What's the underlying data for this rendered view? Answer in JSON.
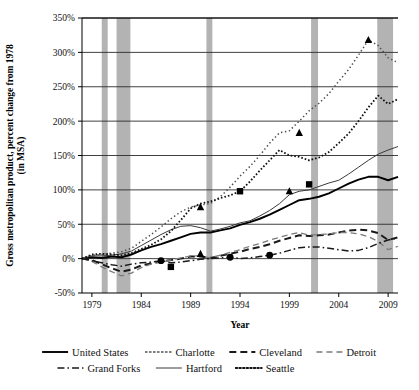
{
  "chart_data": {
    "type": "line",
    "title": "",
    "xlabel": "Year",
    "ylabel": "Gross metropolitan product, percent change from 1978 (in MSA)",
    "ylabel_line1": "Gross metropolitan product, percent change from 1978",
    "ylabel_line2": "(in MSA)",
    "xlim": [
      1978,
      2010
    ],
    "ylim": [
      -50,
      350
    ],
    "ytick_step": 50,
    "grid": true,
    "legend_position": "bottom",
    "xticks": [
      1979,
      1984,
      1989,
      1994,
      1999,
      2004,
      2009
    ],
    "xtick_labels": [
      "1979",
      "1984",
      "1989",
      "1994",
      "1999",
      "2004",
      "2009"
    ],
    "yticks": [
      -50,
      0,
      50,
      100,
      150,
      200,
      250,
      300,
      350
    ],
    "ytick_labels": [
      "-50%",
      "0%",
      "50%",
      "100%",
      "150%",
      "200%",
      "250%",
      "300%",
      "350%"
    ],
    "recessions": [
      {
        "start": 1980.0,
        "end": 1980.6
      },
      {
        "start": 1981.5,
        "end": 1982.9
      },
      {
        "start": 1990.6,
        "end": 1991.2
      },
      {
        "start": 2001.2,
        "end": 2001.9
      },
      {
        "start": 2007.9,
        "end": 2009.5
      }
    ],
    "x": [
      1978,
      1979,
      1980,
      1981,
      1982,
      1983,
      1984,
      1985,
      1986,
      1987,
      1988,
      1989,
      1990,
      1991,
      1992,
      1993,
      1994,
      1995,
      1996,
      1997,
      1998,
      1999,
      2000,
      2001,
      2002,
      2003,
      2004,
      2005,
      2006,
      2007,
      2008,
      2009,
      2010
    ],
    "series": [
      {
        "name": "United States",
        "style": "solid",
        "width": 1.9,
        "color": "#000000",
        "marker": "none",
        "values": [
          0,
          2,
          1,
          3,
          2,
          6,
          12,
          17,
          21,
          26,
          31,
          36,
          38,
          38,
          41,
          44,
          49,
          53,
          58,
          64,
          71,
          78,
          85,
          87,
          90,
          95,
          102,
          109,
          115,
          119,
          119,
          114,
          119
        ]
      },
      {
        "name": "Charlotte",
        "style": "dotted-coarse",
        "width": 1.5,
        "color": "#4d4d4d",
        "marker": "triangle",
        "marker_points": [
          {
            "x": 1990,
            "y": 75
          },
          {
            "x": 2000,
            "y": 183
          },
          {
            "x": 2007,
            "y": 318
          }
        ],
        "values": [
          0,
          5,
          6,
          8,
          10,
          15,
          25,
          35,
          46,
          58,
          68,
          75,
          78,
          80,
          90,
          104,
          120,
          134,
          150,
          168,
          183,
          186,
          200,
          215,
          226,
          240,
          258,
          275,
          296,
          318,
          310,
          292,
          285
        ]
      },
      {
        "name": "Cleveland",
        "style": "dashed-thick",
        "width": 2.0,
        "color": "#1a1a1a",
        "marker": "none",
        "values": [
          0,
          -2,
          -8,
          -14,
          -19,
          -16,
          -10,
          -7,
          -4,
          -2,
          0,
          3,
          3,
          1,
          4,
          7,
          10,
          14,
          17,
          21,
          26,
          30,
          34,
          33,
          34,
          35,
          38,
          41,
          42,
          41,
          37,
          27,
          31
        ]
      },
      {
        "name": "Detroit",
        "style": "dashed-light",
        "width": 1.3,
        "color": "#7a7a7a",
        "marker": "none",
        "values": [
          0,
          -4,
          -12,
          -19,
          -25,
          -21,
          -13,
          -8,
          -5,
          -2,
          1,
          4,
          4,
          1,
          5,
          9,
          13,
          18,
          22,
          27,
          31,
          35,
          38,
          34,
          35,
          36,
          38,
          38,
          36,
          32,
          25,
          13,
          18
        ]
      },
      {
        "name": "Grand Forks",
        "style": "dashdot",
        "width": 1.5,
        "color": "#1a1a1a",
        "marker": "circle",
        "marker_points": [
          {
            "x": 1986,
            "y": -3
          },
          {
            "x": 1993,
            "y": 2
          },
          {
            "x": 1997,
            "y": 5
          }
        ],
        "values": [
          0,
          -3,
          -6,
          -9,
          -11,
          -8,
          -6,
          -5,
          -3,
          -6,
          -5,
          -3,
          -1,
          0,
          1,
          2,
          0,
          1,
          3,
          5,
          8,
          12,
          16,
          17,
          17,
          15,
          13,
          11,
          12,
          16,
          22,
          27,
          30
        ]
      },
      {
        "name": "Hartford",
        "style": "solid-thin",
        "width": 1.0,
        "color": "#3a3a3a",
        "marker": "triangle",
        "marker_points": [
          {
            "x": 1990,
            "y": 7
          },
          {
            "x": 1999,
            "y": 98
          }
        ],
        "values": [
          0,
          4,
          4,
          5,
          7,
          11,
          19,
          27,
          35,
          42,
          47,
          48,
          45,
          40,
          43,
          47,
          52,
          55,
          62,
          70,
          80,
          93,
          98,
          100,
          105,
          110,
          114,
          123,
          133,
          143,
          152,
          158,
          163
        ]
      },
      {
        "name": "Seattle",
        "style": "dotted-fine",
        "width": 1.8,
        "color": "#111111",
        "marker": "square",
        "marker_points": [
          {
            "x": 1987,
            "y": -12
          },
          {
            "x": 1994,
            "y": 98
          },
          {
            "x": 2001,
            "y": 108
          }
        ],
        "values": [
          0,
          6,
          7,
          6,
          5,
          8,
          14,
          20,
          28,
          40,
          56,
          73,
          80,
          83,
          88,
          92,
          98,
          112,
          128,
          143,
          158,
          150,
          148,
          143,
          147,
          155,
          168,
          182,
          200,
          220,
          237,
          225,
          232
        ]
      }
    ],
    "legend_rows": [
      [
        "United States",
        "Charlotte",
        "Cleveland",
        "Detroit"
      ],
      [
        "Grand Forks",
        "Hartford",
        "Seattle"
      ]
    ]
  }
}
